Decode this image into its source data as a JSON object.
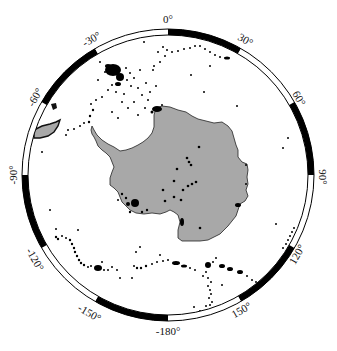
{
  "map": {
    "projection": "south-polar-stereographic",
    "center": [
      168,
      175
    ],
    "outer_radius": 146,
    "inner_radius": 140,
    "colors": {
      "land": "#a8a8a8",
      "land_outline": "#222222",
      "events": "#000000",
      "ring_dark": "#000000",
      "ring_light": "#ffffff",
      "background": "#ffffff"
    },
    "ring_segments": [
      {
        "from": 0,
        "to": 30,
        "fill": "dark"
      },
      {
        "from": 30,
        "to": 60,
        "fill": "light"
      },
      {
        "from": 60,
        "to": 90,
        "fill": "dark"
      },
      {
        "from": 90,
        "to": 120,
        "fill": "light"
      },
      {
        "from": 120,
        "to": 150,
        "fill": "dark"
      },
      {
        "from": 150,
        "to": 180,
        "fill": "light"
      },
      {
        "from": 180,
        "to": 210,
        "fill": "dark"
      },
      {
        "from": 210,
        "to": 240,
        "fill": "light"
      },
      {
        "from": 240,
        "to": 270,
        "fill": "dark"
      },
      {
        "from": 270,
        "to": 300,
        "fill": "light"
      },
      {
        "from": 300,
        "to": 330,
        "fill": "dark"
      },
      {
        "from": 330,
        "to": 360,
        "fill": "light"
      }
    ],
    "longitude_labels": [
      {
        "text": "0°",
        "x": 168,
        "y": 20,
        "rotate": 0
      },
      {
        "text": "30°",
        "x": 245,
        "y": 41,
        "rotate": 30
      },
      {
        "text": "60°",
        "x": 298,
        "y": 99,
        "rotate": 60
      },
      {
        "text": "90°",
        "x": 322,
        "y": 177,
        "rotate": 90
      },
      {
        "text": "120°",
        "x": 298,
        "y": 255,
        "rotate": -60
      },
      {
        "text": "150°",
        "x": 242,
        "y": 311,
        "rotate": -30
      },
      {
        "text": "-180°",
        "x": 168,
        "y": 332,
        "rotate": 0
      },
      {
        "text": "-150°",
        "x": 89,
        "y": 314,
        "rotate": 30
      },
      {
        "text": "-120°",
        "x": 34,
        "y": 260,
        "rotate": 60
      },
      {
        "text": "-90°",
        "x": 14,
        "y": 175,
        "rotate": -90
      },
      {
        "text": "-60°",
        "x": 36,
        "y": 98,
        "rotate": -60
      },
      {
        "text": "-30°",
        "x": 92,
        "y": 40,
        "rotate": -30
      }
    ]
  }
}
